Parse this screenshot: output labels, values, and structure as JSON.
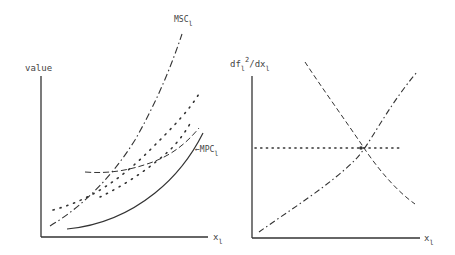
{
  "left_panel": {
    "y_label": "value",
    "x_label": "x",
    "x_label_sub": "l",
    "curves": [
      {
        "name": "MSC",
        "sub": "l",
        "style": "dash-dot",
        "label": "MSC"
      },
      {
        "name": "MPC",
        "sub": "l",
        "style": "solid",
        "label": "←MPC"
      },
      {
        "name": "upper-dotted",
        "style": "dotted",
        "label": ""
      },
      {
        "name": "dashed",
        "style": "dashed",
        "label": ""
      }
    ]
  },
  "right_panel": {
    "y_label": "df",
    "y_label_sub": "l",
    "y_label_sup": "2",
    "y_label_rest": "/dx",
    "y_label_sub2": "l",
    "x_label": "x",
    "x_label_sub": "l",
    "curves": [
      {
        "name": "decreasing",
        "style": "dashed"
      },
      {
        "name": "increasing",
        "style": "dash-dot"
      },
      {
        "name": "horizontal",
        "style": "dotted"
      }
    ]
  },
  "colors": {
    "ink": "#333333",
    "background": "#ffffff"
  }
}
